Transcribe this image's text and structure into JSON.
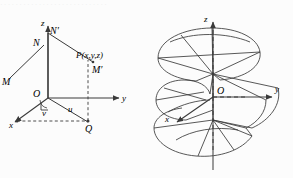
{
  "page": {
    "background": "#fcfcfc",
    "ink": "#3a3a3a",
    "top_partial_text": "····························"
  },
  "figures": [
    {
      "id": "coordinate-frame",
      "type": "diagram",
      "description": "3D rectangular coordinate frame with point P and its projections",
      "axes": [
        {
          "name": "z",
          "label": "z",
          "direction": "up"
        },
        {
          "name": "y",
          "label": "y",
          "direction": "right"
        },
        {
          "name": "x",
          "label": "x",
          "direction": "down-left"
        }
      ],
      "points": [
        {
          "name": "origin",
          "label": "O"
        },
        {
          "name": "point-p",
          "label": "P(x,y,z)"
        },
        {
          "name": "point-n",
          "label": "N"
        },
        {
          "name": "point-n-prime",
          "label": "N′"
        },
        {
          "name": "point-m",
          "label": "M"
        },
        {
          "name": "point-m-prime",
          "label": "M′"
        },
        {
          "name": "point-q",
          "label": "Q"
        }
      ],
      "angles": [
        {
          "name": "angle-u",
          "label": "u"
        },
        {
          "name": "angle-v",
          "label": "v"
        }
      ],
      "right_angle_marker": true
    },
    {
      "id": "helicoid-surface",
      "type": "diagram",
      "description": "Helicoid (screw surface) winding about the z-axis",
      "axes": [
        {
          "name": "z",
          "label": "z",
          "direction": "up"
        },
        {
          "name": "y",
          "label": "y",
          "direction": "right"
        },
        {
          "name": "x",
          "label": "x",
          "direction": "down-left"
        }
      ],
      "points": [
        {
          "name": "origin",
          "label": "O"
        }
      ],
      "turns": 2
    }
  ]
}
